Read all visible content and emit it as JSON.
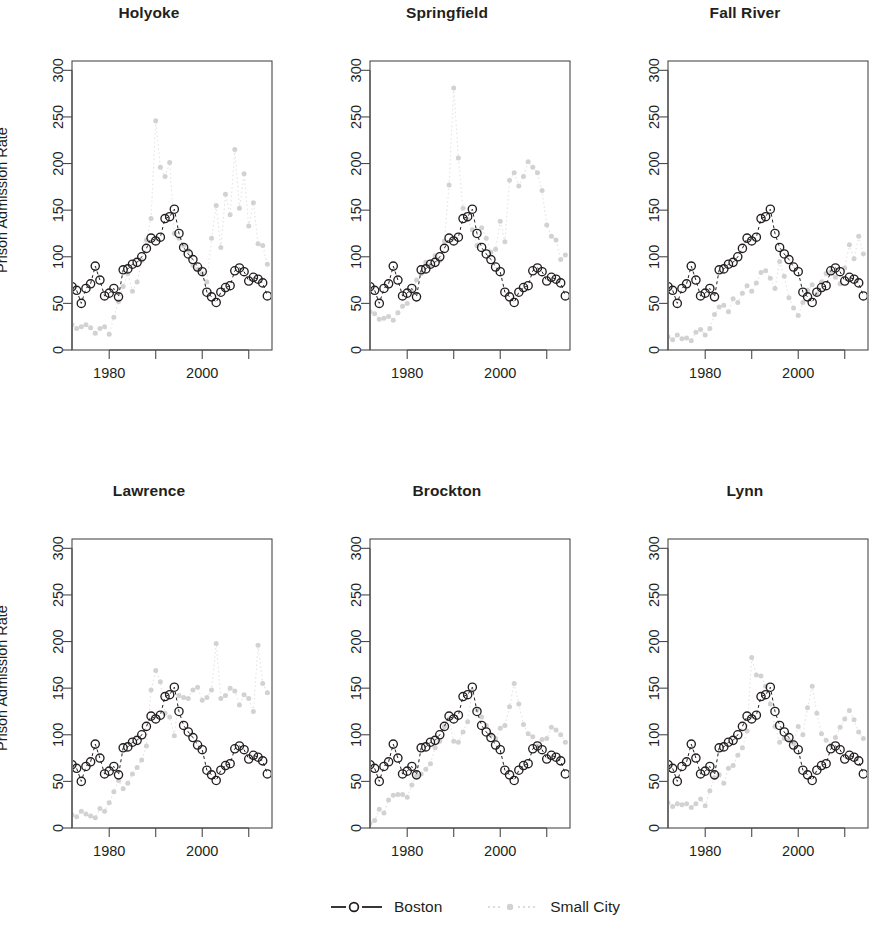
{
  "figure": {
    "ylabel": "Prison Admission Rate",
    "axis_color": "#4a4a4a",
    "boston_color": "#231f20",
    "smallcity_color": "#d2d2d2"
  },
  "legend": {
    "position": "bottom-center",
    "entries": [
      {
        "label": "Boston",
        "marker": "open-circle",
        "line": "dashed",
        "color": "#231f20"
      },
      {
        "label": "Small City",
        "marker": "dot",
        "line": "dotted",
        "color": "#d2d2d2"
      }
    ]
  },
  "chart_data": {
    "type": "scatter",
    "xlabel": "",
    "ylabel": "Prison Admission Rate",
    "xlim": [
      1972,
      2015
    ],
    "ylim": [
      0,
      310
    ],
    "yticks": [
      0,
      50,
      100,
      150,
      200,
      250,
      300
    ],
    "xticks": [
      1980,
      1990,
      2000,
      2010
    ],
    "xtick_labels": [
      "1980",
      "",
      "2000",
      ""
    ],
    "grid": false,
    "legend_position": "bottom",
    "x": [
      1972,
      1973,
      1974,
      1975,
      1976,
      1977,
      1978,
      1979,
      1980,
      1981,
      1982,
      1983,
      1984,
      1985,
      1986,
      1987,
      1988,
      1989,
      1990,
      1991,
      1992,
      1993,
      1994,
      1995,
      1996,
      1997,
      1998,
      1999,
      2000,
      2001,
      2002,
      2003,
      2004,
      2005,
      2006,
      2007,
      2008,
      2009,
      2010,
      2011,
      2012,
      2013,
      2014
    ],
    "boston": [
      68,
      64,
      50,
      66,
      71,
      90,
      75,
      58,
      61,
      66,
      57,
      86,
      87,
      92,
      94,
      100,
      109,
      120,
      117,
      121,
      141,
      143,
      151,
      125,
      110,
      103,
      97,
      89,
      84,
      62,
      57,
      51,
      62,
      67,
      69,
      85,
      88,
      84,
      74,
      78,
      76,
      72,
      58
    ],
    "panels": [
      {
        "name": "Holyoke",
        "row": 0,
        "col": 0,
        "small_city": [
          27,
          23,
          25,
          27,
          24,
          18,
          23,
          25,
          17,
          35,
          52,
          68,
          82,
          63,
          73,
          96,
          118,
          141,
          246,
          196,
          186,
          201,
          125,
          120,
          112,
          107,
          91,
          86,
          82,
          73,
          120,
          155,
          110,
          167,
          145,
          215,
          152,
          189,
          133,
          158,
          114,
          112,
          92
        ]
      },
      {
        "name": "Springfield",
        "row": 0,
        "col": 1,
        "small_city": [
          41,
          39,
          33,
          34,
          36,
          32,
          40,
          47,
          50,
          63,
          75,
          82,
          94,
          91,
          101,
          96,
          117,
          177,
          281,
          206,
          152,
          140,
          129,
          112,
          131,
          120,
          105,
          108,
          138,
          116,
          182,
          190,
          176,
          186,
          202,
          196,
          190,
          171,
          134,
          122,
          118,
          97,
          102
        ]
      },
      {
        "name": "Fall River",
        "row": 0,
        "col": 2,
        "small_city": [
          14,
          11,
          16,
          12,
          13,
          10,
          19,
          22,
          16,
          23,
          38,
          46,
          48,
          41,
          55,
          51,
          61,
          69,
          63,
          72,
          83,
          85,
          77,
          66,
          95,
          79,
          56,
          45,
          37,
          51,
          64,
          70,
          60,
          73,
          82,
          84,
          78,
          71,
          88,
          113,
          98,
          122,
          103
        ]
      },
      {
        "name": "Lawrence",
        "row": 1,
        "col": 0,
        "small_city": [
          14,
          12,
          18,
          15,
          13,
          11,
          21,
          18,
          27,
          39,
          51,
          42,
          48,
          58,
          65,
          73,
          88,
          148,
          169,
          157,
          123,
          119,
          99,
          142,
          140,
          139,
          148,
          151,
          137,
          140,
          148,
          198,
          139,
          142,
          150,
          147,
          132,
          143,
          139,
          125,
          196,
          155,
          145
        ]
      },
      {
        "name": "Brockton",
        "row": 1,
        "col": 1,
        "small_city": [
          5,
          8,
          20,
          16,
          30,
          35,
          36,
          36,
          33,
          46,
          56,
          58,
          63,
          69,
          86,
          93,
          109,
          117,
          93,
          92,
          103,
          114,
          147,
          127,
          119,
          110,
          100,
          96,
          107,
          110,
          130,
          155,
          133,
          111,
          101,
          98,
          88,
          95,
          96,
          108,
          105,
          100,
          92
        ]
      },
      {
        "name": "Lynn",
        "row": 1,
        "col": 2,
        "small_city": [
          27,
          23,
          26,
          25,
          26,
          22,
          26,
          31,
          24,
          40,
          54,
          57,
          48,
          64,
          67,
          78,
          86,
          104,
          183,
          164,
          163,
          152,
          133,
          109,
          92,
          96,
          94,
          91,
          109,
          100,
          129,
          152,
          123,
          101,
          94,
          89,
          97,
          108,
          117,
          126,
          116,
          103,
          96
        ]
      }
    ]
  }
}
